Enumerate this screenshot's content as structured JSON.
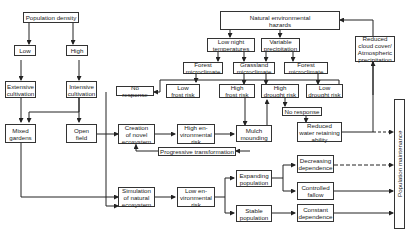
{
  "nodes": {
    "population_density": "Population density",
    "low": "Low",
    "high": "High",
    "extensive_cultivation": "Extensive\ncultivation",
    "intensive_cultivation": "Intensive\ncultivation",
    "mixed_gardens": "Mixed\ngardens",
    "open_field": "Open\nfield",
    "natural_hazards": "Natural environmental\nhazards",
    "low_night_temperatures": "Low night\ntemperatures",
    "variable_precipitation": "Variable\nprecipitation",
    "forest_microclimate_1": "Forest\nmicroclimate",
    "grassland_microclimate": "Grassland\nmicroclimate",
    "forest_microclimate_2": "Forest\nmicroclimate",
    "no_response_1": "No response",
    "low_frost_risk": "Low\nfrost risk",
    "high_frost_risk": "High\nfrost risk",
    "high_drought_risk": "High\ndrought risk",
    "low_drought_risk": "Low\ndrought risk",
    "no_response_2": "No response",
    "reduced_cloud_cover": "Reduced\ncloud cover/\nAtmospheric\nprecipitation",
    "creation_novel_ecosystem": "Creation\nof novel\necosystem",
    "high_env_risk": "High en-\nvironmental\nrisk",
    "mulch_mounding": "Mulch\nmounding",
    "reduced_water": "Reduced\nwater retaining\nability",
    "progressive_transformation": "Progressive transformation",
    "simulation_natural_ecosystem": "Simulation\nof natural\necosystem",
    "low_env_risk": "Low en-\nvironmental\nrisk",
    "expanding_population": "Expanding\npopulation",
    "stable_population": "Stable\npopulation",
    "decreasing_dependence": "Decreasing\ndependence",
    "controlled_fallow": "Controlled\nfallow",
    "constant_dependence": "Constant\ndependence",
    "population_maintenance": "Population maintenance"
  }
}
